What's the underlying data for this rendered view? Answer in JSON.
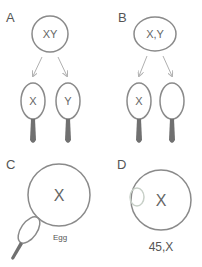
{
  "diagram": {
    "colors": {
      "outline": "#8a8a8a",
      "arrow": "#b0b0b0",
      "tail": "#707070",
      "lost_chromosome": "#c8d0c8",
      "text": "#555555"
    },
    "panels": [
      {
        "label": "A",
        "parent_cell": "XY",
        "sperm": [
          {
            "chromosome": "X"
          },
          {
            "chromosome": "Y"
          }
        ]
      },
      {
        "label": "B",
        "parent_cell": "X,Y",
        "sperm": [
          {
            "chromosome": "X"
          },
          {
            "chromosome": ""
          }
        ]
      },
      {
        "label": "C",
        "egg_chromosome": "X",
        "egg_label": "Egg"
      },
      {
        "label": "D",
        "zygote_chromosome": "X",
        "karyotype": "45,X"
      }
    ]
  }
}
